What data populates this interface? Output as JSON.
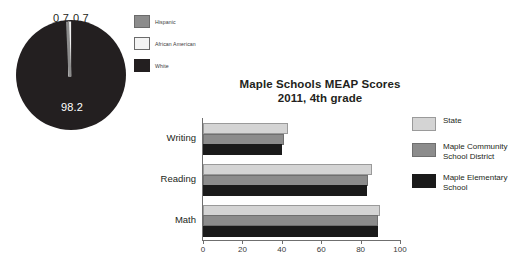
{
  "pie": {
    "labels_outside": [
      "0.7",
      "0.7"
    ],
    "label_inside": "98.2",
    "legend": [
      {
        "key": "hispanic",
        "label": "Hispanic",
        "color": "#8c8c8c",
        "value": 0.7
      },
      {
        "key": "african-american",
        "label": "African American",
        "color": "#f4f4f4",
        "value": 0.7
      },
      {
        "key": "white",
        "label": "White",
        "color": "#231f20",
        "value": 98.2
      }
    ]
  },
  "bar": {
    "title": "Maple Schools MEAP Scores",
    "subtitle": "2011, 4th grade",
    "legend": [
      {
        "key": "state",
        "label": "State",
        "color": "#d4d4d4"
      },
      {
        "key": "district",
        "label": "Maple Community School District",
        "color": "#8c8c8c"
      },
      {
        "key": "elementary",
        "label": "Maple Elementary School",
        "color": "#1a1a1a"
      }
    ],
    "categories": [
      "Writing",
      "Reading",
      "Math"
    ],
    "ticks": [
      "0",
      "20",
      "40",
      "60",
      "80",
      "100"
    ]
  },
  "chart_data": [
    {
      "type": "pie",
      "title": "",
      "labels": [
        "Hispanic",
        "African American",
        "White"
      ],
      "values": [
        0.7,
        0.7,
        98.2
      ],
      "data_labels": [
        "0.7",
        "0.7",
        "98.2"
      ],
      "colors": [
        "#8c8c8c",
        "#f4f4f4",
        "#231f20"
      ],
      "legend_position": "right"
    },
    {
      "type": "bar",
      "orientation": "horizontal",
      "title": "Maple Schools MEAP Scores",
      "subtitle": "2011, 4th grade",
      "categories": [
        "Math",
        "Reading",
        "Writing"
      ],
      "series": [
        {
          "name": "State",
          "color": "#d4d4d4",
          "values": [
            90,
            86,
            43
          ]
        },
        {
          "name": "Maple Community School District",
          "color": "#8c8c8c",
          "values": [
            89,
            84,
            41
          ]
        },
        {
          "name": "Maple Elementary School",
          "color": "#1a1a1a",
          "values": [
            89,
            83,
            40
          ]
        }
      ],
      "xlabel": "",
      "ylabel": "",
      "xlim": [
        0,
        100
      ],
      "xticks": [
        0,
        20,
        40,
        60,
        80,
        100
      ],
      "grid": false,
      "legend_position": "right"
    }
  ]
}
